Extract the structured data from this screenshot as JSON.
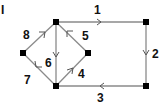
{
  "figure_label": "I",
  "graph": {
    "directed": true,
    "nodes": [
      {
        "id": "A",
        "x": 23,
        "y": 53
      },
      {
        "id": "B",
        "x": 56,
        "y": 22
      },
      {
        "id": "C",
        "x": 56,
        "y": 86
      },
      {
        "id": "D",
        "x": 88,
        "y": 53
      },
      {
        "id": "E",
        "x": 146,
        "y": 22
      },
      {
        "id": "F",
        "x": 146,
        "y": 86
      }
    ],
    "edges": [
      {
        "label": "1",
        "from": "B",
        "to": "E"
      },
      {
        "label": "2",
        "from": "E",
        "to": "F"
      },
      {
        "label": "3",
        "from": "F",
        "to": "C"
      },
      {
        "label": "4",
        "from": "C",
        "to": "D"
      },
      {
        "label": "5",
        "from": "D",
        "to": "B"
      },
      {
        "label": "6",
        "from": "B",
        "to": "C"
      },
      {
        "label": "7",
        "from": "C",
        "to": "A"
      },
      {
        "label": "8",
        "from": "A",
        "to": "B"
      }
    ]
  },
  "colors": {
    "edge": "#8a8a8a",
    "node": "#000000",
    "background": "#ffffff"
  }
}
